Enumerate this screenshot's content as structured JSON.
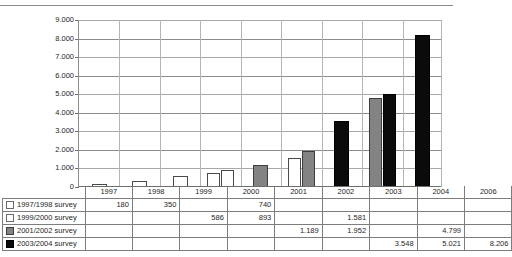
{
  "top_fragment": "",
  "chart_data": {
    "type": "bar",
    "title": "",
    "subtitle": "",
    "xlabel": "",
    "ylabel": "",
    "ylim": [
      0,
      9000
    ],
    "ytick_labels": [
      "9.000",
      "8.000",
      "7.000",
      "6.000",
      "5.000",
      "4.000",
      "3.000",
      "2.000",
      "1.000",
      "0"
    ],
    "ytick_values": [
      9000,
      8000,
      7000,
      6000,
      5000,
      4000,
      3000,
      2000,
      1000,
      0
    ],
    "grid": true,
    "legend_position": "table-left",
    "categories": [
      "1997",
      "1998",
      "1999",
      "2000",
      "2001",
      "2002",
      "2003",
      "2004",
      "2006"
    ],
    "series": [
      {
        "name": "1997/1998 survey",
        "color": "#ffffff",
        "values": [
          180,
          350,
          null,
          740,
          null,
          null,
          null,
          null,
          null
        ],
        "labels": [
          "180",
          "350",
          "",
          "740",
          "",
          "",
          "",
          "",
          ""
        ]
      },
      {
        "name": "1999/2000 survey",
        "color": "#ffffff",
        "values": [
          null,
          null,
          586,
          893,
          null,
          1581,
          null,
          null,
          null
        ],
        "labels": [
          "",
          "",
          "586",
          "893",
          "",
          "1.581",
          "",
          "",
          ""
        ]
      },
      {
        "name": "2001/2002 survey",
        "color": "#838383",
        "values": [
          null,
          null,
          null,
          null,
          1189,
          1952,
          null,
          4799,
          null
        ],
        "labels": [
          "",
          "",
          "",
          "",
          "1.189",
          "1.952",
          "",
          "4.799",
          ""
        ]
      },
      {
        "name": "2003/2004 survey",
        "color": "#0b0b0b",
        "values": [
          null,
          null,
          null,
          null,
          null,
          null,
          3548,
          5021,
          8206
        ],
        "labels": [
          "",
          "",
          "",
          "",
          "",
          "",
          "3.548",
          "5.021",
          "8.206"
        ]
      }
    ]
  },
  "table": {
    "corner_label": "",
    "column_headers": [
      "1997",
      "1998",
      "1999",
      "2000",
      "2001",
      "2002",
      "2003",
      "2004",
      "2006"
    ],
    "rows": [
      {
        "label": "1997/1998 survey",
        "swatch": "white-swatch",
        "cells": [
          "180",
          "350",
          "",
          "740",
          "",
          "",
          "",
          "",
          ""
        ]
      },
      {
        "label": "1999/2000 survey",
        "swatch": "white-swatch",
        "cells": [
          "",
          "",
          "586",
          "893",
          "",
          "1.581",
          "",
          "",
          ""
        ]
      },
      {
        "label": "2001/2002 survey",
        "swatch": "gray-swatch",
        "cells": [
          "",
          "",
          "",
          "",
          "1.189",
          "1.952",
          "",
          "4.799",
          ""
        ]
      },
      {
        "label": "2003/2004 survey",
        "swatch": "black-swatch",
        "cells": [
          "",
          "",
          "",
          "",
          "",
          "",
          "3.548",
          "5.021",
          "8.206"
        ]
      }
    ]
  }
}
